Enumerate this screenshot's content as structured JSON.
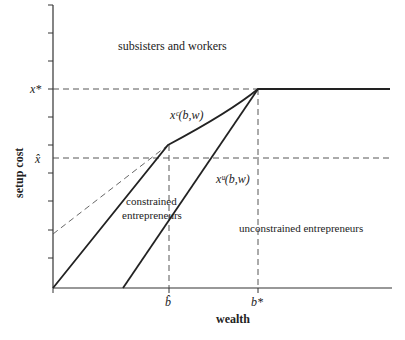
{
  "diagram": {
    "axes": {
      "x_label": "wealth",
      "y_label": "setup cost",
      "x_ticks": [
        {
          "label": "b̂",
          "key": "b_hat"
        },
        {
          "label": "b*",
          "key": "b_star"
        }
      ],
      "y_ticks": [
        {
          "label": "x*",
          "key": "x_star"
        },
        {
          "label": "x̂",
          "key": "x_hat"
        }
      ]
    },
    "regions": {
      "top": "subsisters and workers",
      "middle_line1": "constrained",
      "middle_line2": "entrepreneurs",
      "right": "unconstrained entrepreneurs"
    },
    "curves": {
      "constrained": "xᶜ(b,w)",
      "unconstrained": "xᵘ(b,w)"
    }
  }
}
